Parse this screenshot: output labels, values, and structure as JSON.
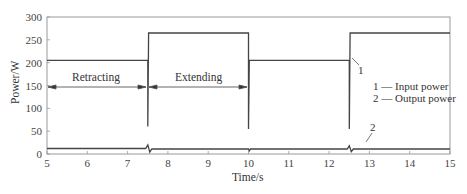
{
  "chart_data": {
    "type": "line",
    "title": "",
    "xlabel": "Time/s",
    "ylabel": "Power/W",
    "xlim": [
      5,
      15
    ],
    "ylim": [
      0,
      300
    ],
    "x_ticks": [
      5,
      6,
      7,
      8,
      9,
      10,
      11,
      12,
      13,
      14,
      15
    ],
    "y_ticks": [
      0,
      50,
      100,
      150,
      200,
      250,
      300
    ],
    "grid": false,
    "legend": {
      "position": "right-middle",
      "entries": [
        "1 — Input power",
        "2 — Output power"
      ]
    },
    "series": [
      {
        "name": "Input power",
        "id": "1",
        "points": [
          [
            5,
            205
          ],
          [
            7.5,
            205
          ],
          [
            7.5,
            60
          ],
          [
            7.52,
            265
          ],
          [
            10,
            265
          ],
          [
            10,
            55
          ],
          [
            10.02,
            205
          ],
          [
            12.5,
            205
          ],
          [
            12.5,
            55
          ],
          [
            12.52,
            265
          ],
          [
            15,
            265
          ]
        ]
      },
      {
        "name": "Output power",
        "id": "2",
        "points": [
          [
            5,
            12
          ],
          [
            7.45,
            12
          ],
          [
            7.5,
            20
          ],
          [
            7.55,
            4
          ],
          [
            7.6,
            11
          ],
          [
            10,
            11
          ],
          [
            10.02,
            7
          ],
          [
            10.05,
            11
          ],
          [
            12.45,
            11
          ],
          [
            12.5,
            18
          ],
          [
            12.55,
            5
          ],
          [
            12.6,
            11
          ],
          [
            15,
            11
          ]
        ]
      }
    ],
    "annotations": [
      {
        "text": "Retracting",
        "x_range": [
          5,
          7.5
        ],
        "y": 145
      },
      {
        "text": "Extending",
        "x_range": [
          7.5,
          10
        ],
        "y": 145
      },
      {
        "text": "1",
        "x": 12.8,
        "y": 170
      },
      {
        "text": "2",
        "x": 13.0,
        "y": 30
      }
    ]
  },
  "labels": {
    "xlabel": "Time/s",
    "ylabel": "Power/W",
    "retracting": "Retracting",
    "extending": "Extending",
    "legend_1": "1 — Input power",
    "legend_2": "2 — Output power",
    "callout_1": "1",
    "callout_2": "2"
  },
  "ticks": {
    "x": [
      "5",
      "6",
      "7",
      "8",
      "9",
      "10",
      "11",
      "12",
      "13",
      "14",
      "15"
    ],
    "y": [
      "0",
      "50",
      "100",
      "150",
      "200",
      "250",
      "300"
    ]
  }
}
